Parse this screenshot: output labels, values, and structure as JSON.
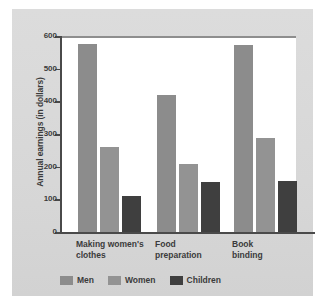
{
  "chart_data": {
    "type": "bar",
    "title": "",
    "xlabel": "",
    "ylabel": "Annual earnings (in dollars)",
    "ylim": [
      0,
      600
    ],
    "yticks": [
      "600",
      "500",
      "400",
      "300",
      "200",
      "100",
      "0"
    ],
    "grid": false,
    "legend_position": "bottom",
    "categories": [
      "Making women's\nclothes",
      "Food\npreparation",
      "Book\nbinding"
    ],
    "series": [
      {
        "name": "Men",
        "color": "#8c8c8c",
        "values": [
          583,
          425,
          578
        ]
      },
      {
        "name": "Women",
        "color": "#939393",
        "values": [
          265,
          215,
          295
        ]
      },
      {
        "name": "Children",
        "color": "#3f3f3f",
        "values": [
          115,
          158,
          162
        ]
      }
    ]
  },
  "legend": [
    {
      "label": "Men"
    },
    {
      "label": "Women"
    },
    {
      "label": "Children"
    }
  ]
}
